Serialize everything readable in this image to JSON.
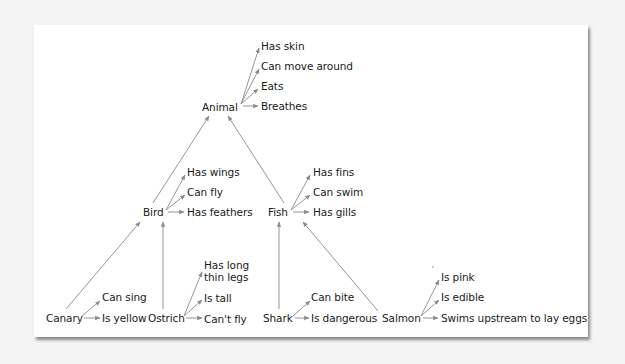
{
  "diagram": {
    "type": "semantic-network",
    "edge_color": "#8a8a8a",
    "nodes": {
      "animal": {
        "label": "Animal",
        "properties": [
          "Has skin",
          "Can move around",
          "Eats",
          "Breathes"
        ]
      },
      "bird": {
        "label": "Bird",
        "properties": [
          "Has wings",
          "Can fly",
          "Has feathers"
        ]
      },
      "fish": {
        "label": "Fish",
        "properties": [
          "Has fins",
          "Can swim",
          "Has gills"
        ]
      },
      "canary": {
        "label": "Canary",
        "properties": [
          "Can sing",
          "Is yellow"
        ]
      },
      "ostrich": {
        "label": "Ostrich",
        "properties": [
          "Has long",
          "thin legs",
          "Is tall",
          "Can't fly"
        ]
      },
      "shark": {
        "label": "Shark",
        "properties": [
          "Can bite",
          "Is dangerous"
        ]
      },
      "salmon": {
        "label": "Salmon",
        "properties": [
          "Is pink",
          "Is edible",
          "Swims upstream to lay eggs"
        ]
      }
    },
    "isa_links": [
      {
        "from": "Bird",
        "to": "Animal"
      },
      {
        "from": "Fish",
        "to": "Animal"
      },
      {
        "from": "Canary",
        "to": "Bird"
      },
      {
        "from": "Ostrich",
        "to": "Bird"
      },
      {
        "from": "Shark",
        "to": "Fish"
      },
      {
        "from": "Salmon",
        "to": "Fish"
      }
    ]
  }
}
